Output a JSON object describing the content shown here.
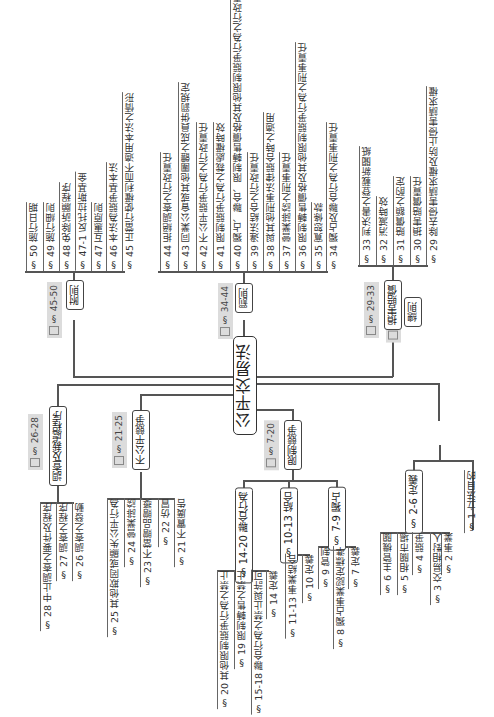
{
  "title": "公平交易法",
  "orientation": "rotated-180",
  "branches": [
    {
      "label": "總則",
      "range": "§ 1-6",
      "children": [
        {
          "label": "§ 1  立法目的"
        },
        {
          "label": "§ 2-6  定義",
          "children": [
            {
              "label": "§ 2  事業"
            },
            {
              "label": "§ 3  交易相對人"
            },
            {
              "label": "§ 4  競爭"
            },
            {
              "label": "§ 5  相關市場"
            },
            {
              "label": "§ 6  主管機關"
            }
          ]
        }
      ]
    },
    {
      "label": "限制競爭",
      "range": "§ 7-20",
      "children": [
        {
          "label": "§ 7-9  獨占",
          "children": [
            {
              "label": "§ 7  定義"
            },
            {
              "label": "§ 8  獨占事業認定標準"
            },
            {
              "label": "§ 9  管制"
            }
          ]
        },
        {
          "label": "§ 10-13  結合",
          "children": [
            {
              "label": "§ 10  定義"
            },
            {
              "label": "§ 11-13  事業結合"
            }
          ]
        },
        {
          "label": "§ 14-20  聯合行為",
          "children": [
            {
              "label": "§ 14  定義"
            },
            {
              "label": "§ 15-18  聯合行為之禁止與許可"
            },
            {
              "label": "§ 19  限制轉售之禁止"
            },
            {
              "label": "§ 20  其他限制競爭行為之禁止"
            }
          ]
        }
      ]
    },
    {
      "label": "不公平競爭",
      "range": "§ 21-25",
      "children": [
        {
          "label": "§ 21  不實廣告"
        },
        {
          "label": "§ 22  仿冒"
        },
        {
          "label": "§ 23  不當贈品贈獎"
        },
        {
          "label": "§ 24  營業誹謗"
        },
        {
          "label": "§ 25  其他欺罔或顯失公平行為"
        }
      ]
    },
    {
      "label": "調查及裁處程序",
      "range": "§ 26-28",
      "children": [
        {
          "label": "§ 26  調查之發動"
        },
        {
          "label": "§ 27  調查之程序"
        },
        {
          "label": "§ 28  中止調查之要件及程序"
        }
      ]
    },
    {
      "label": "損害賠償",
      "range": "§ 29-33",
      "children": [
        {
          "label": "§ 29  除去侵害請求權及防止侵害請求權"
        },
        {
          "label": "§ 30  損害賠償責任"
        },
        {
          "label": "§ 31  賠償額之酌定"
        },
        {
          "label": "§ 32  消滅時效"
        },
        {
          "label": "§ 33  判決書之登載新聞紙"
        }
      ]
    },
    {
      "label": "罰則",
      "range": "§ 34-44",
      "children": [
        {
          "label": "§ 34  獨占及聯合行為之刑事責任"
        },
        {
          "label": "§ 35  寬恕條款"
        },
        {
          "label": "§ 36  限制轉售價格及其他限制競爭行為之刑事責任"
        },
        {
          "label": "§ 37  營業誹謗之刑事責任"
        },
        {
          "label": "§ 38  與其他刑事法律競合時之適用"
        },
        {
          "label": "§ 39  違法結合之行政責任"
        },
        {
          "label": "§ 40  獨占、聯合、限制轉售價格及其他限制競爭行為之行政責任"
        },
        {
          "label": "§ 41  限制競爭行為之裁處權時效"
        },
        {
          "label": "§ 42  不公平競爭行為之行政責任"
        },
        {
          "label": "§ 43  同業公會或其他團體之成員併罰規定"
        },
        {
          "label": "§ 44  拒絕調查之行政責任"
        }
      ]
    },
    {
      "label": "附則",
      "range": "§ 45-50",
      "children": [
        {
          "label": "§ 45  正當行使權利而不適用本法之情形"
        },
        {
          "label": "§ 46  本法為競爭基本法"
        },
        {
          "label": "§ 47  互惠原則"
        },
        {
          "label": "§ 47-1  反托拉斯基金"
        },
        {
          "label": "§ 48  免除訴願程序"
        },
        {
          "label": "§ 49  施行細則"
        },
        {
          "label": "§ 50  施行日期"
        }
      ]
    }
  ]
}
